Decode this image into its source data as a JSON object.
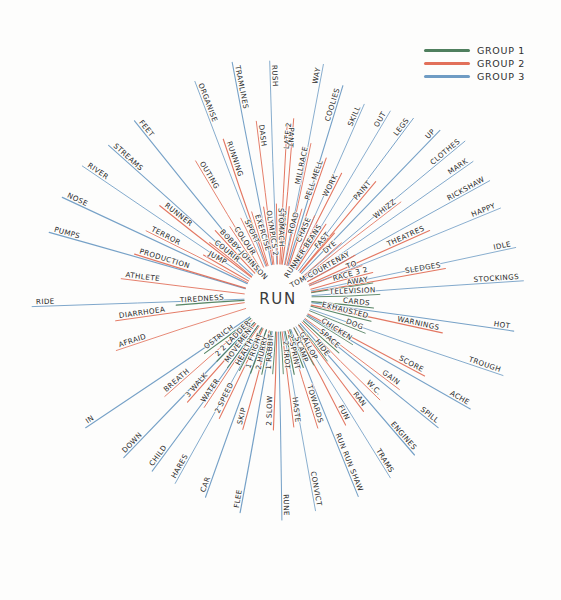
{
  "page": {
    "background_color": "#fdfdfc",
    "width": 561,
    "height": 600
  },
  "center": {
    "label": "RUN"
  },
  "legend": {
    "position": "top-right",
    "items": [
      {
        "label": "GROUP 1",
        "color": "#4f7f5e"
      },
      {
        "label": "GROUP 2",
        "color": "#e2705a"
      },
      {
        "label": "GROUP 3",
        "color": "#6f9cc4"
      }
    ]
  },
  "colors": {
    "group1": "#4f7f5e",
    "group2": "#e2705a",
    "group3": "#6f9cc4",
    "text": "#2a2a2a",
    "center_text": "#3a3a3a"
  },
  "chart_data": {
    "type": "radial-word-association",
    "title": "RUN",
    "legend": [
      "GROUP 1",
      "GROUP 2",
      "GROUP 3"
    ],
    "note": "Hand-drawn radial diagram: each spoke is a word association radiating from the centre word RUN; spoke length encodes association distance and colour encodes respondent group.",
    "spokes": [
      {
        "label": "WAY",
        "group": 3,
        "angle": -79,
        "r0": 34,
        "r1": 238
      },
      {
        "label": "COOLIES",
        "group": 3,
        "angle": -73,
        "r0": 34,
        "r1": 222
      },
      {
        "label": "SKILL",
        "group": 3,
        "angle": -66,
        "r0": 34,
        "r1": 212
      },
      {
        "label": "OUT",
        "group": 3,
        "angle": -59,
        "r0": 34,
        "r1": 218
      },
      {
        "label": "LEGS",
        "group": 3,
        "angle": -53,
        "r0": 34,
        "r1": 225
      },
      {
        "label": "UP",
        "group": 3,
        "angle": -46,
        "r0": 34,
        "r1": 233
      },
      {
        "label": "CLOTHES",
        "group": 3,
        "angle": -40,
        "r0": 34,
        "r1": 244
      },
      {
        "label": "MARK",
        "group": 3,
        "angle": -35,
        "r0": 34,
        "r1": 238
      },
      {
        "label": "RICKSHAW",
        "group": 3,
        "angle": -29,
        "r0": 34,
        "r1": 242
      },
      {
        "label": "HAPPY",
        "group": 3,
        "angle": -22,
        "r0": 34,
        "r1": 240
      },
      {
        "label": "IDLE",
        "group": 3,
        "angle": -12,
        "r0": 34,
        "r1": 243
      },
      {
        "label": "STOCKINGS",
        "group": 3,
        "angle": -4,
        "r0": 34,
        "r1": 246
      },
      {
        "label": "HOT",
        "group": 3,
        "angle": 8,
        "r0": 34,
        "r1": 238
      },
      {
        "label": "TROUGH",
        "group": 3,
        "angle": 19,
        "r0": 34,
        "r1": 238
      },
      {
        "label": "ACHE",
        "group": 3,
        "angle": 30,
        "r0": 34,
        "r1": 222
      },
      {
        "label": "SPILL",
        "group": 3,
        "angle": 39,
        "r0": 34,
        "r1": 206
      },
      {
        "label": "ENGINES",
        "group": 3,
        "angle": 49,
        "r0": 34,
        "r1": 208
      },
      {
        "label": "TRAMS",
        "group": 3,
        "angle": 58,
        "r0": 34,
        "r1": 212
      },
      {
        "label": "RUN RUN SHAW",
        "group": 3,
        "angle": 68,
        "r0": 34,
        "r1": 214
      },
      {
        "label": "CONVICT",
        "group": 3,
        "angle": 80,
        "r0": 34,
        "r1": 216
      },
      {
        "label": "RUNE",
        "group": 3,
        "angle": 89,
        "r0": 34,
        "r1": 222
      },
      {
        "label": "FLEE",
        "group": 3,
        "angle": 100,
        "r0": 34,
        "r1": 218
      },
      {
        "label": "CAR",
        "group": 3,
        "angle": 110,
        "r0": 34,
        "r1": 212
      },
      {
        "label": "HARES",
        "group": 3,
        "angle": 119,
        "r0": 34,
        "r1": 212
      },
      {
        "label": "CHILD",
        "group": 3,
        "angle": 126,
        "r0": 34,
        "r1": 214
      },
      {
        "label": "DOWN",
        "group": 3,
        "angle": 134,
        "r0": 34,
        "r1": 222
      },
      {
        "label": "IN",
        "group": 3,
        "angle": 146,
        "r0": 34,
        "r1": 232
      },
      {
        "label": "RIDE",
        "group": 3,
        "angle": 178,
        "r0": 34,
        "r1": 246
      },
      {
        "label": "PUMPS",
        "group": 3,
        "angle": 196,
        "r0": 34,
        "r1": 238
      },
      {
        "label": "NOSE",
        "group": 3,
        "angle": 205,
        "r0": 34,
        "r1": 238
      },
      {
        "label": "RIVER",
        "group": 3,
        "angle": 214,
        "r0": 34,
        "r1": 236
      },
      {
        "label": "STREAMS",
        "group": 3,
        "angle": 222,
        "r0": 34,
        "r1": 228
      },
      {
        "label": "FEET",
        "group": 3,
        "angle": 231,
        "r0": 34,
        "r1": 228
      },
      {
        "label": "ORGANISE",
        "group": 3,
        "angle": 249,
        "r0": 34,
        "r1": 232
      },
      {
        "label": "TRAMLINES",
        "group": 3,
        "angle": 259,
        "r0": 34,
        "r1": 240
      },
      {
        "label": "RUSH",
        "group": 3,
        "angle": 268,
        "r0": 34,
        "r1": 237
      },
      {
        "label": "LATE 2",
        "group": 2,
        "angle": -85,
        "r0": 34,
        "r1": 180
      },
      {
        "label": "MILLRACE",
        "group": 2,
        "angle": -78,
        "r0": 34,
        "r1": 158
      },
      {
        "label": "PELL-MELL",
        "group": 2,
        "angle": -71,
        "r0": 34,
        "r1": 148
      },
      {
        "label": "WORK",
        "group": 2,
        "angle": -63,
        "r0": 34,
        "r1": 140
      },
      {
        "label": "PAINT",
        "group": 2,
        "angle": -50,
        "r0": 34,
        "r1": 152
      },
      {
        "label": "WHIZZ",
        "group": 2,
        "angle": -38,
        "r0": 34,
        "r1": 156
      },
      {
        "label": "THEATRES",
        "group": 2,
        "angle": -24,
        "r0": 34,
        "r1": 166
      },
      {
        "label": "SLEDGES",
        "group": 2,
        "angle": -10,
        "r0": 34,
        "r1": 170
      },
      {
        "label": "WARNINGS",
        "group": 2,
        "angle": 12,
        "r0": 34,
        "r1": 168
      },
      {
        "label": "SCORE",
        "group": 2,
        "angle": 28,
        "r0": 34,
        "r1": 166
      },
      {
        "label": "GAIN",
        "group": 2,
        "angle": 37,
        "r0": 34,
        "r1": 152
      },
      {
        "label": "W.C.",
        "group": 2,
        "angle": 45,
        "r0": 34,
        "r1": 144
      },
      {
        "label": "RAN",
        "group": 2,
        "angle": 53,
        "r0": 34,
        "r1": 142
      },
      {
        "label": "FUN",
        "group": 2,
        "angle": 62,
        "r0": 34,
        "r1": 144
      },
      {
        "label": "TOWARDS",
        "group": 2,
        "angle": 73,
        "r0": 34,
        "r1": 136
      },
      {
        "label": "HASTE",
        "group": 2,
        "angle": 83,
        "r0": 34,
        "r1": 130
      },
      {
        "label": "2 SLOW",
        "group": 2,
        "angle": 92,
        "r0": 34,
        "r1": 132
      },
      {
        "label": "SKIP",
        "group": 2,
        "angle": 105,
        "r0": 34,
        "r1": 136
      },
      {
        "label": "2 SPEED",
        "group": 2,
        "angle": 116,
        "r0": 34,
        "r1": 134
      },
      {
        "label": "WATER",
        "group": 2,
        "angle": 124,
        "r0": 34,
        "r1": 132
      },
      {
        "label": "3 WALK",
        "group": 2,
        "angle": 131,
        "r0": 34,
        "r1": 138
      },
      {
        "label": "BREATH",
        "group": 2,
        "angle": 139,
        "r0": 34,
        "r1": 150
      },
      {
        "label": "AFRAID",
        "group": 2,
        "angle": 162,
        "r0": 34,
        "r1": 170
      },
      {
        "label": "DIARRHOEA",
        "group": 2,
        "angle": 172,
        "r0": 34,
        "r1": 164
      },
      {
        "label": "ATHLETE",
        "group": 2,
        "angle": 187,
        "r0": 34,
        "r1": 158
      },
      {
        "label": "PRODUCTION",
        "group": 2,
        "angle": 197,
        "r0": 34,
        "r1": 150
      },
      {
        "label": "TERROR",
        "group": 2,
        "angle": 207,
        "r0": 34,
        "r1": 148
      },
      {
        "label": "RUNNER",
        "group": 2,
        "angle": 218,
        "r0": 34,
        "r1": 150
      },
      {
        "label": "OUTING",
        "group": 2,
        "angle": 239,
        "r0": 34,
        "r1": 160
      },
      {
        "label": "RUNNING",
        "group": 2,
        "angle": 251,
        "r0": 34,
        "r1": 168
      },
      {
        "label": "DASH",
        "group": 2,
        "angle": 263,
        "r0": 34,
        "r1": 178
      },
      {
        "label": "PANT",
        "group": 2,
        "angle": 273,
        "r0": 34,
        "r1": 175
      },
      {
        "label": "RACE 3 2",
        "group": 2,
        "angle": -15,
        "r0": 34,
        "r1": 98
      },
      {
        "label": "TO",
        "group": 2,
        "angle": -21,
        "r0": 34,
        "r1": 90
      },
      {
        "label": "TOM COURTENAY",
        "group": 2,
        "angle": -29,
        "r0": 34,
        "r1": 88
      },
      {
        "label": "DYE",
        "group": 2,
        "angle": -41,
        "r0": 34,
        "r1": 84
      },
      {
        "label": "FAST",
        "group": 2,
        "angle": -49,
        "r0": 34,
        "r1": 86
      },
      {
        "label": "RUNNER BEANS",
        "group": 2,
        "angle": -57,
        "r0": 34,
        "r1": 88
      },
      {
        "label": "CHASE",
        "group": 2,
        "angle": -66,
        "r0": 34,
        "r1": 90
      },
      {
        "label": "ROAD",
        "group": 2,
        "angle": -75,
        "r0": 34,
        "r1": 92
      },
      {
        "label": "JOG",
        "group": 2,
        "angle": -83,
        "r0": 34,
        "r1": 92
      },
      {
        "label": "STOMACH",
        "group": 2,
        "angle": -91,
        "r0": 34,
        "r1": 94
      },
      {
        "label": "OLYMPICS 2",
        "group": 2,
        "angle": -99,
        "r0": 34,
        "r1": 92
      },
      {
        "label": "EXERCISE",
        "group": 2,
        "angle": -107,
        "r0": 34,
        "r1": 90
      },
      {
        "label": "SPORT",
        "group": 2,
        "angle": -115,
        "r0": 34,
        "r1": 88
      },
      {
        "label": "COLOUR",
        "group": 2,
        "angle": -124,
        "r0": 34,
        "r1": 86
      },
      {
        "label": "BOBBY JOHNSON",
        "group": 2,
        "angle": -133,
        "r0": 34,
        "r1": 92
      },
      {
        "label": "COURIR",
        "group": 2,
        "angle": -141,
        "r0": 34,
        "r1": 88
      },
      {
        "label": "JUMP",
        "group": 2,
        "angle": -150,
        "r0": 34,
        "r1": 86
      },
      {
        "label": "AWAY",
        "group": 1,
        "angle": -9,
        "r0": 34,
        "r1": 96
      },
      {
        "label": "TELEVISION",
        "group": 1,
        "angle": -2,
        "r0": 34,
        "r1": 102
      },
      {
        "label": "CARDS",
        "group": 1,
        "angle": 6,
        "r0": 34,
        "r1": 96
      },
      {
        "label": "EXHAUSTED",
        "group": 1,
        "angle": 14,
        "r0": 34,
        "r1": 96
      },
      {
        "label": "DOG",
        "group": 1,
        "angle": 22,
        "r0": 34,
        "r1": 94
      },
      {
        "label": "CHICKEN",
        "group": 1,
        "angle": 32,
        "r0": 34,
        "r1": 88
      },
      {
        "label": "SPACE",
        "group": 1,
        "angle": 42,
        "r0": 34,
        "r1": 82
      },
      {
        "label": "HIDE",
        "group": 1,
        "angle": 52,
        "r0": 34,
        "r1": 80
      },
      {
        "label": "GALLOP",
        "group": 1,
        "angle": 62,
        "r0": 34,
        "r1": 76
      },
      {
        "label": "SCAMP",
        "group": 1,
        "angle": 70,
        "r0": 34,
        "r1": 74
      },
      {
        "label": "2 SPRINT",
        "group": 1,
        "angle": 78,
        "r0": 34,
        "r1": 78
      },
      {
        "label": "2 TROT",
        "group": 1,
        "angle": 86,
        "r0": 34,
        "r1": 76
      },
      {
        "label": "1 RABBIT",
        "group": 1,
        "angle": 94,
        "r0": 34,
        "r1": 76
      },
      {
        "label": "2 HURRY",
        "group": 1,
        "angle": 102,
        "r0": 34,
        "r1": 78
      },
      {
        "label": "1 FRIGHT",
        "group": 1,
        "angle": 110,
        "r0": 34,
        "r1": 80
      },
      {
        "label": "HEALTH",
        "group": 1,
        "angle": 118,
        "r0": 34,
        "r1": 82
      },
      {
        "label": "MOVEMENT",
        "group": 1,
        "angle": 126,
        "r0": 34,
        "r1": 86
      },
      {
        "label": "2 2 LADDER",
        "group": 1,
        "angle": 134,
        "r0": 34,
        "r1": 88
      },
      {
        "label": "OSTRICH",
        "group": 1,
        "angle": 143,
        "r0": 34,
        "r1": 92
      },
      {
        "label": "TIREDNESS",
        "group": 1,
        "angle": 176,
        "r0": 34,
        "r1": 102
      }
    ]
  }
}
